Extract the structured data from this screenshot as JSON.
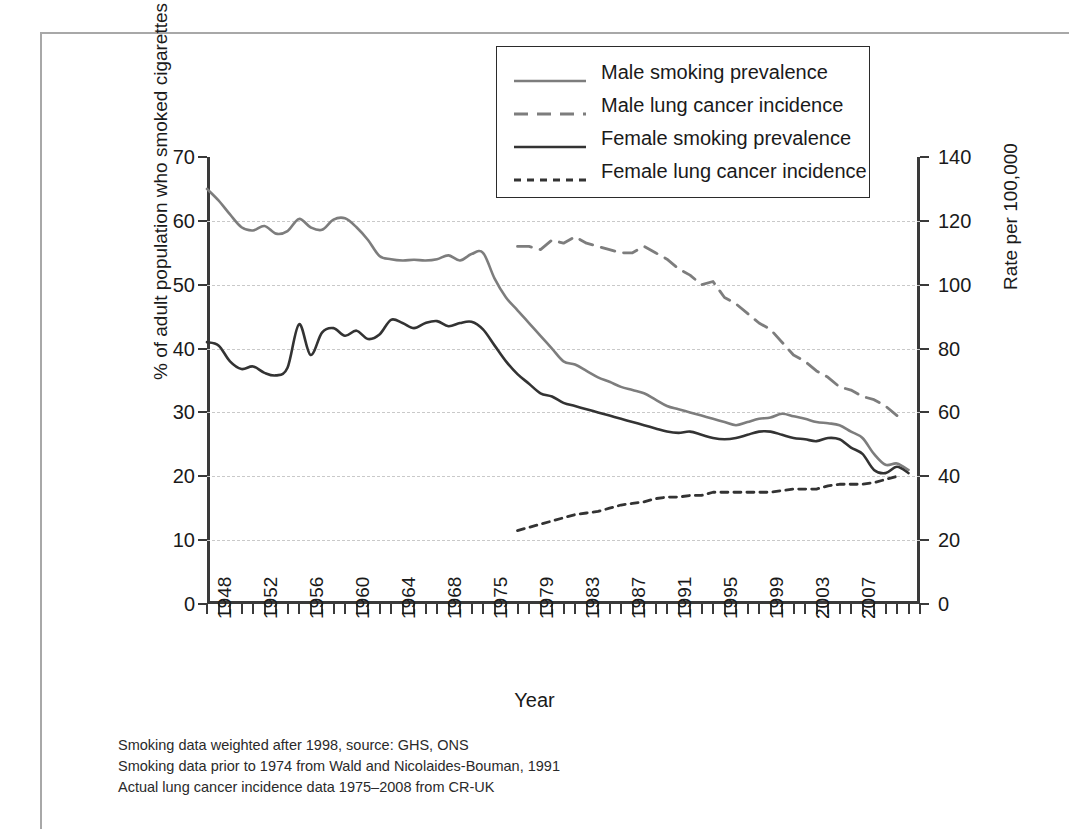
{
  "axis_titles": {
    "left": "% of adult population who smoked cigarettes",
    "right": "Rate per 100,000",
    "x": "Year"
  },
  "legend": {
    "items": [
      {
        "label": "Male smoking prevalence",
        "style": "solid",
        "color": "#7d7d7d"
      },
      {
        "label": "Male lung cancer incidence",
        "style": "dashed-long",
        "color": "#7d7d7d"
      },
      {
        "label": "Female smoking prevalence",
        "style": "solid",
        "color": "#333333"
      },
      {
        "label": "Female lung cancer incidence",
        "style": "dashed-short",
        "color": "#333333"
      }
    ]
  },
  "notes": [
    "Smoking data weighted after 1998, source: GHS, ONS",
    "Smoking data prior to 1974 from Wald and Nicolaides-Bouman, 1991",
    "Actual lung cancer incidence data 1975–2008 from CR-UK"
  ],
  "chart_data": {
    "type": "line",
    "title": "",
    "xlabel": "Year",
    "ylabel": "% of adult population who smoked cigarettes",
    "y2label": "Rate per 100,000",
    "grid": true,
    "legend_position": "top-center",
    "xlim": [
      1948,
      2010
    ],
    "ylim": [
      0,
      70
    ],
    "y2lim": [
      0,
      140
    ],
    "ytick_labels": [
      "0",
      "10",
      "20",
      "30",
      "40",
      "50",
      "60",
      "70"
    ],
    "yticks": [
      0,
      10,
      20,
      30,
      40,
      50,
      60,
      70
    ],
    "y2tick_labels": [
      "0",
      "20",
      "40",
      "60",
      "80",
      "100",
      "120",
      "140"
    ],
    "y2ticks": [
      0,
      20,
      40,
      60,
      80,
      100,
      120,
      140
    ],
    "xtick_labels": [
      "1948",
      "1952",
      "1956",
      "1960",
      "1964",
      "1968",
      "1975",
      "1979",
      "1983",
      "1987",
      "1991",
      "1995",
      "1999",
      "2003",
      "2007"
    ],
    "xticks": [
      1948,
      1952,
      1956,
      1960,
      1964,
      1968,
      1972,
      1976,
      1980,
      1984,
      1988,
      1992,
      1996,
      2000,
      2004
    ],
    "series": [
      {
        "name": "Male smoking prevalence",
        "axis": "left",
        "style": "solid",
        "color": "#7d7d7d",
        "x": [
          1948,
          1949,
          1950,
          1951,
          1952,
          1953,
          1954,
          1955,
          1956,
          1957,
          1958,
          1959,
          1960,
          1961,
          1962,
          1963,
          1964,
          1965,
          1966,
          1967,
          1968,
          1969,
          1970,
          1971,
          1972,
          1973,
          1974,
          1975,
          1976,
          1977,
          1978,
          1979,
          1980,
          1981,
          1982,
          1983,
          1984,
          1985,
          1986,
          1987,
          1988,
          1989,
          1990,
          1991,
          1992,
          1993,
          1994,
          1995,
          1996,
          1997,
          1998,
          1999,
          2000,
          2001,
          2002,
          2003,
          2004,
          2005,
          2006,
          2007,
          2008,
          2009
        ],
        "y": [
          65.0,
          63.2,
          61.0,
          59.0,
          58.5,
          59.2,
          58.0,
          58.4,
          60.3,
          59.0,
          58.6,
          60.2,
          60.4,
          59.0,
          57.0,
          54.5,
          54.0,
          53.8,
          53.9,
          53.8,
          54.0,
          54.6,
          53.8,
          54.8,
          55.0,
          51.0,
          48.0,
          46.0,
          44.0,
          42.0,
          40.0,
          38.0,
          37.5,
          36.5,
          35.5,
          34.8,
          34.0,
          33.5,
          33.0,
          32.0,
          31.0,
          30.5,
          30.0,
          29.5,
          29.0,
          28.5,
          28.0,
          28.5,
          29.0,
          29.2,
          29.8,
          29.4,
          29.0,
          28.5,
          28.3,
          28.0,
          27.0,
          26.0,
          23.5,
          21.8,
          22.0,
          21.0
        ]
      },
      {
        "name": "Female smoking prevalence",
        "axis": "left",
        "style": "solid",
        "color": "#333333",
        "x": [
          1948,
          1949,
          1950,
          1951,
          1952,
          1953,
          1954,
          1955,
          1956,
          1957,
          1958,
          1959,
          1960,
          1961,
          1962,
          1963,
          1964,
          1965,
          1966,
          1967,
          1968,
          1969,
          1970,
          1971,
          1972,
          1973,
          1974,
          1975,
          1976,
          1977,
          1978,
          1979,
          1980,
          1981,
          1982,
          1983,
          1984,
          1985,
          1986,
          1987,
          1988,
          1989,
          1990,
          1991,
          1992,
          1993,
          1994,
          1995,
          1996,
          1997,
          1998,
          1999,
          2000,
          2001,
          2002,
          2003,
          2004,
          2005,
          2006,
          2007,
          2008,
          2009
        ],
        "y": [
          41.0,
          40.5,
          38.0,
          36.8,
          37.2,
          36.2,
          35.8,
          37.0,
          43.8,
          39.0,
          42.5,
          43.2,
          42.0,
          42.8,
          41.5,
          42.2,
          44.5,
          44.0,
          43.2,
          44.0,
          44.3,
          43.5,
          44.0,
          44.2,
          43.0,
          40.5,
          38.0,
          36.0,
          34.5,
          33.0,
          32.5,
          31.5,
          31.0,
          30.5,
          30.0,
          29.5,
          29.0,
          28.5,
          28.0,
          27.5,
          27.0,
          26.8,
          27.0,
          26.5,
          26.0,
          25.8,
          26.0,
          26.5,
          27.0,
          27.0,
          26.5,
          26.0,
          25.8,
          25.5,
          26.0,
          25.8,
          24.5,
          23.5,
          21.0,
          20.5,
          21.5,
          20.5
        ]
      },
      {
        "name": "Male lung cancer incidence",
        "axis": "right",
        "style": "dashed-long",
        "color": "#7d7d7d",
        "x": [
          1975,
          1976,
          1977,
          1978,
          1979,
          1980,
          1981,
          1982,
          1983,
          1984,
          1985,
          1986,
          1987,
          1988,
          1989,
          1990,
          1991,
          1992,
          1993,
          1994,
          1995,
          1996,
          1997,
          1998,
          1999,
          2000,
          2001,
          2002,
          2003,
          2004,
          2005,
          2006,
          2007,
          2008
        ],
        "y": [
          112,
          112,
          111,
          114,
          113,
          115,
          113,
          112,
          111,
          110,
          110,
          112,
          110,
          108,
          105,
          103,
          100,
          101,
          96,
          94,
          91,
          88,
          86,
          82,
          78,
          76,
          73,
          71,
          68,
          67,
          65,
          64,
          62,
          59
        ]
      },
      {
        "name": "Female lung cancer incidence",
        "axis": "right",
        "style": "dashed-short",
        "color": "#333333",
        "x": [
          1975,
          1976,
          1977,
          1978,
          1979,
          1980,
          1981,
          1982,
          1983,
          1984,
          1985,
          1986,
          1987,
          1988,
          1989,
          1990,
          1991,
          1992,
          1993,
          1994,
          1995,
          1996,
          1997,
          1998,
          1999,
          2000,
          2001,
          2002,
          2003,
          2004,
          2005,
          2006,
          2007,
          2008
        ],
        "y": [
          23,
          24,
          25,
          26,
          27,
          28,
          28.5,
          29,
          30,
          31,
          31.5,
          32,
          33,
          33.5,
          33.5,
          34,
          34,
          35,
          35,
          35,
          35,
          35,
          35,
          35.5,
          36,
          36,
          36,
          37,
          37.5,
          37.5,
          37.5,
          38,
          39,
          40
        ]
      }
    ]
  }
}
